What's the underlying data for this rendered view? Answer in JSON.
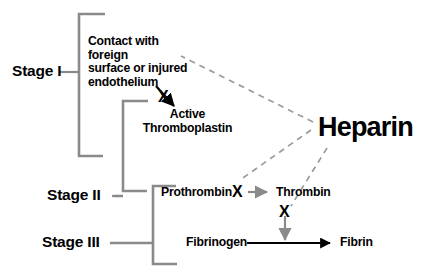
{
  "diagram": {
    "colors": {
      "text": "#000000",
      "bracket": "#8a8a8a",
      "gray_arrow": "#8a8a8a",
      "dashed": "#9a9a9a",
      "black_arrow": "#000000",
      "background": "#ffffff"
    }
  },
  "stages": [
    {
      "id": "stage-1",
      "label": "Stage I"
    },
    {
      "id": "stage-2",
      "label": "Stage II"
    },
    {
      "id": "stage-3",
      "label": "Stage III"
    }
  ],
  "nodes": {
    "contact": "Contact with foreign surface or injured endothelium",
    "contact_line1": "Contact with foreign",
    "contact_line2": "surface or injured",
    "contact_line3": "endothelium",
    "active_thromboplastin_line1": "Active",
    "active_thromboplastin_line2": "Thromboplastin",
    "prothrombin": "Prothrombin",
    "thrombin": "Thrombin",
    "fibrinogen": "Fibrinogen",
    "fibrin": "Fibrin",
    "heparin": "Heparin"
  },
  "markers": {
    "x_thromboplastin": "X",
    "x_prothrombin": "X",
    "x_thrombin_fibrinogen": "X"
  }
}
